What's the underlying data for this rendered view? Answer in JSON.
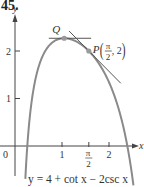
{
  "problem_number": "45.",
  "chart_data": {
    "type": "line",
    "title": "",
    "caption": "y = 4 + cot x − 2csc x",
    "function": "4 + cot(x) - 2/sin(x)",
    "xlabel": "x",
    "ylabel": "y",
    "xlim": [
      0,
      2.75
    ],
    "ylim": [
      -0.6,
      2.6
    ],
    "origin_label": "0",
    "x_ticks": [
      {
        "value": 1,
        "label": "1"
      },
      {
        "value": 1.5708,
        "label_num": "π",
        "label_den": "2"
      },
      {
        "value": 2,
        "label": "2"
      }
    ],
    "y_ticks": [
      {
        "value": 1,
        "label": "1"
      },
      {
        "value": 2,
        "label": "2"
      }
    ],
    "points": [
      {
        "name": "Q",
        "x": 1.0472,
        "y": 2.268,
        "label": "Q"
      },
      {
        "name": "P",
        "x": 1.5708,
        "y": 2,
        "label_prefix": "P",
        "label_num": "π",
        "label_den": "2",
        "label_suffix": ", 2"
      }
    ],
    "tangent_lines": [
      {
        "at": "Q",
        "slope": 0,
        "x_range": [
          0.72,
          1.62
        ]
      },
      {
        "at": "P",
        "slope": -1,
        "x_range": [
          1.15,
          2.25
        ]
      }
    ],
    "grid": false,
    "colors": {
      "curve": "#8a8a8a",
      "axis": "#444444",
      "tangent": "#555555",
      "point": "#9a9a9a"
    }
  }
}
